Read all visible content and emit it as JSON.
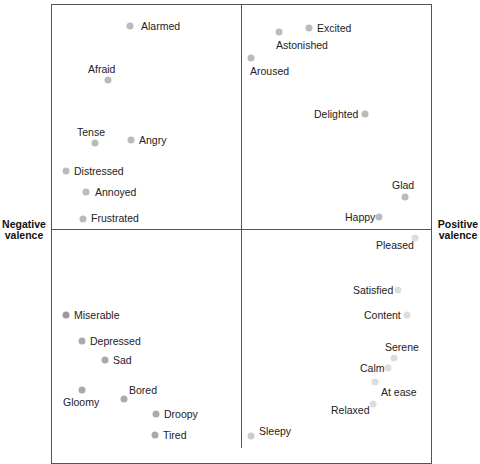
{
  "chart_data": {
    "type": "scatter",
    "title": "",
    "xlabel_left": "Negative valence",
    "xlabel_right": "Positive valence",
    "grid": false,
    "quadrant_divider": {
      "x": 241,
      "y": 229
    },
    "points": [
      {
        "label": "Alarmed",
        "dot": [
          130,
          26
        ],
        "text": [
          141,
          20
        ],
        "color": "#bbbbbb"
      },
      {
        "label": "Afraid",
        "dot": [
          108,
          80
        ],
        "text": [
          88,
          63
        ],
        "color": "#bbbbbb"
      },
      {
        "label": "Tense",
        "dot": [
          95,
          143
        ],
        "text": [
          77,
          126
        ],
        "color": "#bbbbbb"
      },
      {
        "label": "Angry",
        "dot": [
          131,
          140
        ],
        "text": [
          139,
          134
        ],
        "color": "#bbbbbb"
      },
      {
        "label": "Distressed",
        "dot": [
          66,
          171
        ],
        "text": [
          74,
          165
        ],
        "color": "#bbbbbb"
      },
      {
        "label": "Annoyed",
        "dot": [
          86,
          192
        ],
        "text": [
          95,
          186
        ],
        "color": "#bbbbbb"
      },
      {
        "label": "Frustrated",
        "dot": [
          83,
          219
        ],
        "text": [
          91,
          212
        ],
        "color": "#bbbbbb"
      },
      {
        "label": "Excited",
        "dot": [
          309,
          28
        ],
        "text": [
          317,
          22
        ],
        "color": "#bbbbbb"
      },
      {
        "label": "Astonished",
        "dot": [
          279,
          32
        ],
        "text": [
          276,
          39
        ],
        "color": "#bbbbbb"
      },
      {
        "label": "Aroused",
        "dot": [
          251,
          58
        ],
        "text": [
          250,
          65
        ],
        "color": "#bbbbbb"
      },
      {
        "label": "Delighted",
        "dot": [
          365,
          114
        ],
        "text": [
          314,
          108
        ],
        "color": "#bbbbbb"
      },
      {
        "label": "Glad",
        "dot": [
          405,
          197
        ],
        "text": [
          392,
          179
        ],
        "color": "#bbbbbb"
      },
      {
        "label": "Happy",
        "dot": [
          379,
          217
        ],
        "text": [
          345,
          211
        ],
        "color": "#bbbbbb"
      },
      {
        "label": "Pleased",
        "dot": [
          415,
          238
        ],
        "text": [
          376,
          239
        ],
        "color": "#dddddd"
      },
      {
        "label": "Satisfied",
        "dot": [
          398,
          290
        ],
        "text": [
          353,
          284
        ],
        "color": "#dddddd"
      },
      {
        "label": "Content",
        "dot": [
          407,
          315
        ],
        "text": [
          364,
          309
        ],
        "color": "#dddddd"
      },
      {
        "label": "Serene",
        "dot": [
          394,
          358
        ],
        "text": [
          385,
          341
        ],
        "color": "#dddddd"
      },
      {
        "label": "Calm",
        "dot": [
          388,
          368
        ],
        "text": [
          360,
          362
        ],
        "color": "#dddddd"
      },
      {
        "label": "At ease",
        "dot": [
          375,
          382
        ],
        "text": [
          381,
          386
        ],
        "color": "#dddddd"
      },
      {
        "label": "Relaxed",
        "dot": [
          373,
          404
        ],
        "text": [
          331,
          404
        ],
        "color": "#dddddd"
      },
      {
        "label": "Sleepy",
        "dot": [
          251,
          436
        ],
        "text": [
          259,
          425
        ],
        "color": "#cccccc"
      },
      {
        "label": "Miserable",
        "dot": [
          66,
          315
        ],
        "text": [
          74,
          309
        ],
        "color": "#999999"
      },
      {
        "label": "Depressed",
        "dot": [
          82,
          341
        ],
        "text": [
          90,
          335
        ],
        "color": "#aaaaaa"
      },
      {
        "label": "Sad",
        "dot": [
          105,
          360
        ],
        "text": [
          113,
          354
        ],
        "color": "#aaaaaa"
      },
      {
        "label": "Gloomy",
        "dot": [
          82,
          390
        ],
        "text": [
          63,
          396
        ],
        "color": "#aaaaaa"
      },
      {
        "label": "Bored",
        "dot": [
          124,
          399
        ],
        "text": [
          129,
          384
        ],
        "color": "#aaaaaa"
      },
      {
        "label": "Droopy",
        "dot": [
          156,
          414
        ],
        "text": [
          164,
          408
        ],
        "color": "#aaaaaa"
      },
      {
        "label": "Tired",
        "dot": [
          155,
          435
        ],
        "text": [
          163,
          429
        ],
        "color": "#aaaaaa"
      }
    ]
  },
  "axis": {
    "left_line1": "Negative",
    "left_line2": "valence",
    "right_line1": "Positive",
    "right_line2": "valence"
  }
}
